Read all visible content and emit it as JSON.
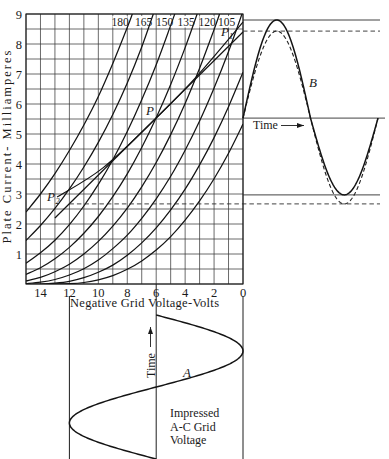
{
  "figure": {
    "y_axis": {
      "label": "Plate Current- Milliamperes",
      "ticks": [
        "1",
        "2",
        "3",
        "4",
        "5",
        "6",
        "7",
        "8",
        "9"
      ]
    },
    "x_axis": {
      "label": "Negative Grid Voltage-Volts",
      "ticks": [
        "14",
        "12",
        "10",
        "8",
        "6",
        "4",
        "2",
        "0"
      ]
    },
    "curve_labels": [
      "180",
      "165",
      "150",
      "135",
      "120",
      "105"
    ],
    "annotations": {
      "P": "P",
      "P1": "P",
      "P1_sub": "1",
      "P2": "P",
      "P2_sub": "2",
      "A": "A",
      "B": "B"
    },
    "plate_current_panel": {
      "time_label": "Time"
    },
    "grid_voltage_panel": {
      "time_label": "Time",
      "caption": [
        "Impressed",
        "A-C Grid",
        "Voltage"
      ]
    }
  },
  "colors": {
    "ink": "#141414",
    "grid": "#3a3a3a",
    "background": "#ffffff"
  },
  "chart_data": {
    "type": "line",
    "title": "",
    "xlabel": "Negative Grid Voltage-Volts",
    "ylabel": "Plate Current- Milliamperes",
    "xlim": [
      15,
      0
    ],
    "ylim": [
      0,
      9
    ],
    "x_ticks": [
      14,
      12,
      10,
      8,
      6,
      4,
      2,
      0
    ],
    "y_ticks": [
      1,
      2,
      3,
      4,
      5,
      6,
      7,
      8,
      9
    ],
    "grid": {
      "on": true,
      "x_step": 1,
      "y_step": 0.5
    },
    "legend": "inline plate-voltage labels along top edge (180, 165, 150, 135, 120, 105)",
    "series": [
      {
        "name": "180",
        "x": [
          15,
          14,
          13,
          12,
          11,
          10,
          9,
          8,
          7.65
        ],
        "y": [
          2.4,
          3.0,
          3.68,
          4.45,
          5.3,
          6.25,
          7.35,
          8.55,
          9.0
        ]
      },
      {
        "name": "165",
        "x": [
          15,
          14,
          13,
          12,
          11,
          10,
          9,
          8,
          7,
          6.2
        ],
        "y": [
          1.45,
          1.95,
          2.52,
          3.17,
          3.9,
          4.72,
          5.65,
          6.7,
          7.9,
          9.0
        ]
      },
      {
        "name": "150",
        "x": [
          15,
          14,
          13,
          12,
          11,
          10,
          9,
          8,
          7,
          6,
          5,
          4.72
        ],
        "y": [
          0.69,
          1.04,
          1.46,
          1.98,
          2.6,
          3.32,
          4.14,
          5.08,
          6.14,
          7.31,
          8.62,
          9.0
        ]
      },
      {
        "name": "135",
        "x": [
          15,
          14,
          13,
          12,
          11,
          10,
          9,
          8,
          7,
          6,
          5,
          4,
          3.17
        ],
        "y": [
          0.32,
          0.54,
          0.84,
          1.22,
          1.69,
          2.25,
          2.91,
          3.67,
          4.55,
          5.54,
          6.65,
          7.88,
          9.0
        ]
      },
      {
        "name": "120",
        "x": [
          15,
          14,
          13,
          12,
          11,
          10,
          9,
          8,
          7,
          6,
          5,
          4,
          3,
          2,
          1.62
        ],
        "y": [
          0.1,
          0.22,
          0.41,
          0.66,
          1.0,
          1.42,
          1.93,
          2.53,
          3.24,
          4.05,
          4.98,
          6.02,
          7.19,
          8.48,
          9.0
        ]
      },
      {
        "name": "105",
        "x": [
          15,
          14,
          13,
          12,
          11,
          10,
          9,
          8,
          7,
          6,
          5,
          4,
          3,
          2,
          1,
          0.07
        ],
        "y": [
          0.01,
          0.06,
          0.15,
          0.3,
          0.51,
          0.8,
          1.18,
          1.63,
          2.19,
          2.84,
          3.59,
          4.46,
          5.43,
          6.53,
          7.75,
          9.0
        ]
      },
      {
        "name": "90",
        "x": [
          14.55,
          14,
          13,
          12,
          11,
          10,
          9,
          8,
          7,
          6,
          5,
          4,
          3,
          2,
          1,
          0
        ],
        "y": [
          0,
          0.0,
          0.03,
          0.09,
          0.21,
          0.39,
          0.63,
          0.96,
          1.37,
          1.87,
          2.47,
          3.16,
          3.97,
          4.88,
          5.91,
          7.06
        ]
      },
      {
        "name": "75",
        "x": [
          13,
          12,
          11,
          10,
          9,
          8,
          7,
          6,
          5,
          4,
          3,
          2,
          1,
          0
        ],
        "y": [
          0,
          0.01,
          0.05,
          0.14,
          0.28,
          0.49,
          0.77,
          1.13,
          1.58,
          2.13,
          2.77,
          3.51,
          4.36,
          5.33
        ]
      }
    ],
    "load_line": {
      "name": "straight line P2-P1",
      "x": [
        13.0,
        0
      ],
      "y": [
        2.2,
        8.4
      ]
    },
    "dynamic_characteristic": {
      "name": "curved line P2-P-P1",
      "x": [
        12.85,
        9.68,
        6.0,
        3.18,
        0
      ],
      "y": [
        2.9,
        3.87,
        5.53,
        6.93,
        8.73
      ]
    },
    "points": [
      {
        "label": "P",
        "x": 6,
        "y": 5.53
      },
      {
        "label": "P1",
        "x": 0.3,
        "y": 8.5
      },
      {
        "label": "P2",
        "x": 12.6,
        "y": 2.7
      }
    ],
    "plate_current_wave": {
      "label": "B",
      "axis_mA": 5.53,
      "cycles": 1,
      "solid": {
        "max_mA": 8.8,
        "min_mA": 2.97
      },
      "dashed": {
        "max_mA": 8.43,
        "min_mA": 2.67
      }
    },
    "grid_voltage_wave": {
      "label": "A",
      "bias_V": 6,
      "amplitude_V": 6,
      "cycles": 1
    }
  }
}
